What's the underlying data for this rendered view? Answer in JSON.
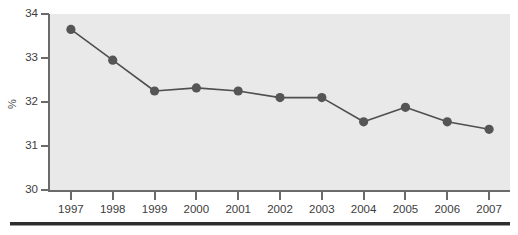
{
  "chart_data": {
    "type": "line",
    "title": "",
    "subtitle": "",
    "xlabel": "",
    "ylabel": "%",
    "categories": [
      "1997",
      "1998",
      "1999",
      "2000",
      "2001",
      "2002",
      "2003",
      "2004",
      "2005",
      "2006",
      "2007"
    ],
    "values": [
      33.65,
      32.95,
      32.25,
      32.32,
      32.25,
      32.1,
      32.1,
      31.55,
      31.88,
      31.55,
      31.38
    ],
    "series": [
      {
        "name": "",
        "values": [
          33.65,
          32.95,
          32.25,
          32.32,
          32.25,
          32.1,
          32.1,
          31.55,
          31.88,
          31.55,
          31.38
        ]
      }
    ],
    "ylim": [
      30,
      34
    ],
    "y_ticks": [
      "34",
      "33",
      "32",
      "31",
      "30"
    ],
    "y_tick_values": [
      34,
      33,
      32,
      31,
      30
    ],
    "x_ticks": [
      "1997",
      "1998",
      "1999",
      "2000",
      "2001",
      "2002",
      "2003",
      "2004",
      "2005",
      "2006",
      "2007"
    ],
    "grid": false,
    "legend": false,
    "legend_position": "none",
    "marker": "circle",
    "colors": {
      "line": "#4f4f4f",
      "marker": "#555555",
      "plot_background": "#e9e9e9",
      "axis": "#6a6a6a",
      "tick_label": "#3c3c3c",
      "page_background": "#ffffff",
      "bottom_rule": "#2e2e2e"
    }
  },
  "axes": {
    "y_axis_title": "%",
    "y_tick_labels": [
      "34",
      "33",
      "32",
      "31",
      "30"
    ],
    "x_tick_labels": [
      "1997",
      "1998",
      "1999",
      "2000",
      "2001",
      "2002",
      "2003",
      "2004",
      "2005",
      "2006",
      "2007"
    ]
  }
}
